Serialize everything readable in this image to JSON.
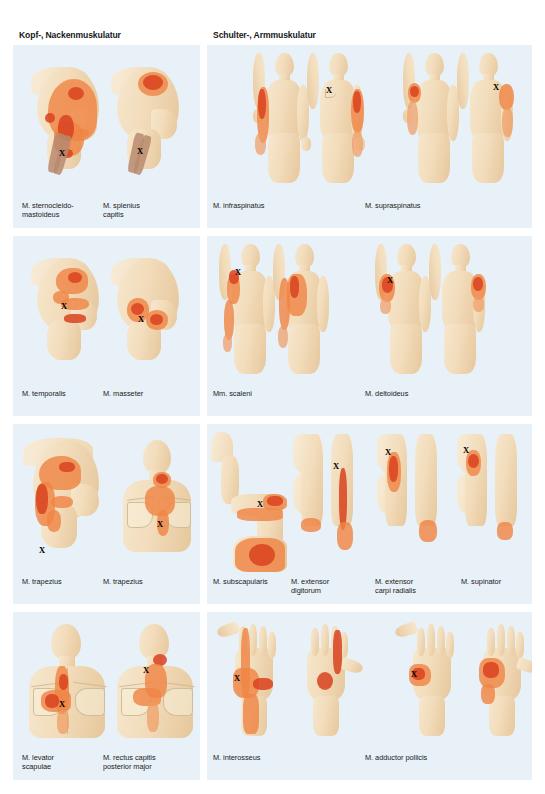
{
  "page": {
    "background": "#ffffff",
    "panel_background": "#e8f1f7",
    "pain_color": "#ef8546",
    "pain_core_color": "#d9441f",
    "skin_color": "#f2dcbb",
    "marker_glyph": "X"
  },
  "headers": {
    "left": "Kopf-, Nackenmuskulatur",
    "right": "Schulter-, Armmuskulatur"
  },
  "panels": [
    {
      "id": "panel-kopf-1",
      "column": "left",
      "row": 1,
      "captions": [
        {
          "name": "caption-sternocleidomastoideus",
          "text": "M. sternocleido-\nmastoideus"
        },
        {
          "name": "caption-splenius-capitis",
          "text": "M. splenius\ncapitis"
        }
      ]
    },
    {
      "id": "panel-schulter-1",
      "column": "right",
      "row": 1,
      "captions": [
        {
          "name": "caption-infraspinatus",
          "text": "M. infraspinatus"
        },
        {
          "name": "caption-supraspinatus",
          "text": "M. supraspinatus"
        }
      ]
    },
    {
      "id": "panel-kopf-2",
      "column": "left",
      "row": 2,
      "captions": [
        {
          "name": "caption-temporalis",
          "text": "M. temporalis"
        },
        {
          "name": "caption-masseter",
          "text": "M. masseter"
        }
      ]
    },
    {
      "id": "panel-schulter-2",
      "column": "right",
      "row": 2,
      "captions": [
        {
          "name": "caption-scaleni",
          "text": "Mm. scaleni"
        },
        {
          "name": "caption-deltoideus",
          "text": "M. deltoideus"
        }
      ]
    },
    {
      "id": "panel-kopf-3",
      "column": "left",
      "row": 3,
      "captions": [
        {
          "name": "caption-trapezius-1",
          "text": "M. trapezius"
        },
        {
          "name": "caption-trapezius-2",
          "text": "M. trapezius"
        }
      ]
    },
    {
      "id": "panel-schulter-3",
      "column": "right",
      "row": 3,
      "captions": [
        {
          "name": "caption-subscapularis",
          "text": "M. subscapularis"
        },
        {
          "name": "caption-extensor-digitorum",
          "text": "M. extensor\ndigitorum"
        },
        {
          "name": "caption-extensor-carpi-radialis",
          "text": "M. extensor\ncarpi radialis"
        },
        {
          "name": "caption-supinator",
          "text": "M. supinator"
        }
      ]
    },
    {
      "id": "panel-kopf-4",
      "column": "left",
      "row": 4,
      "captions": [
        {
          "name": "caption-levator-scapulae",
          "text": "M. levator\nscapulae"
        },
        {
          "name": "caption-rectus-capitis",
          "text": "M. rectus capitis\nposterior major"
        }
      ]
    },
    {
      "id": "panel-schulter-4",
      "column": "right",
      "row": 4,
      "captions": [
        {
          "name": "caption-interosseus",
          "text": "M. interosseus"
        },
        {
          "name": "caption-adductor-pollicis",
          "text": "M. adductor pollicis"
        }
      ]
    }
  ],
  "markers": {
    "sternocleidomastoideus": "X",
    "splenius_capitis": "X",
    "infraspinatus": "X",
    "supraspinatus": "X",
    "temporalis": "X",
    "masseter": "X",
    "scaleni": "X",
    "deltoideus": "X",
    "trapezius_1": "X",
    "trapezius_2": "X",
    "subscapularis": "X",
    "extensor_digitorum": "X",
    "extensor_carpi_radialis": "X",
    "supinator": "X",
    "levator_scapulae": "X",
    "rectus_capitis": "X",
    "interosseus": "X",
    "adductor_pollicis": "X"
  }
}
